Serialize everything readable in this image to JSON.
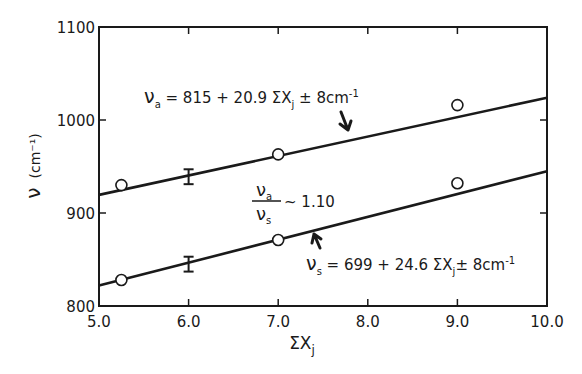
{
  "chart_data": {
    "type": "scatter",
    "title": "",
    "xlabel": "ΣXj",
    "ylabel": "ν (cm⁻¹)",
    "xlim": [
      5.0,
      10.0
    ],
    "ylim": [
      800,
      1100
    ],
    "x_ticks": [
      "5.0",
      "6.0",
      "7.0",
      "8.0",
      "9.0",
      "10.0"
    ],
    "y_ticks": [
      "800",
      "900",
      "1000",
      "1100"
    ],
    "grid": false,
    "series": [
      {
        "name": "νa",
        "points": [
          {
            "x": 5.25,
            "y": 930
          },
          {
            "x": 7.0,
            "y": 963
          },
          {
            "x": 9.0,
            "y": 1016
          }
        ],
        "error_bar": {
          "x": 6.0,
          "y": 939,
          "err": 8
        },
        "fit": {
          "intercept": 815,
          "slope": 20.9,
          "uncertainty": "±8cm-1"
        },
        "annotation": "νa = 815 + 20.9 ΣXj ±8cm⁻¹"
      },
      {
        "name": "νs",
        "points": [
          {
            "x": 5.25,
            "y": 828
          },
          {
            "x": 7.0,
            "y": 871
          },
          {
            "x": 9.0,
            "y": 932
          }
        ],
        "error_bar": {
          "x": 6.0,
          "y": 845,
          "err": 8
        },
        "fit": {
          "intercept": 699,
          "slope": 24.6,
          "uncertainty": "±8cm-1"
        },
        "annotation": "νs = 699 + 24.6 ΣXj ± 8cm⁻¹"
      }
    ],
    "annotations": [
      {
        "text": "νa / νs ~ 1.10",
        "x": 7.1,
        "y": 905
      }
    ]
  },
  "labels": {
    "ylabel_main": "ν",
    "ylabel_unit": "(cm⁻¹)",
    "xlabel_main": "ΣX",
    "xlabel_sub": "j",
    "eq_a_prefix": "ν",
    "eq_a_sub": "a",
    "eq_a_body": " = 815 +  20.9  ΣX",
    "eq_a_sub2": "j",
    "eq_a_tail": " ± 8cm",
    "eq_a_exp": "-1",
    "eq_s_prefix": "ν",
    "eq_s_sub": "s",
    "eq_s_body": " = 699 + 24.6 ΣX",
    "eq_s_sub2": "j",
    "eq_s_tail": "± 8cm",
    "eq_s_exp": "-1",
    "ratio_num": "ν",
    "ratio_num_sub": "a",
    "ratio_den": "ν",
    "ratio_den_sub": "s",
    "ratio_value": "~ 1.10"
  },
  "style": {
    "ink": "#1a1a1a",
    "background": "#ffffff"
  }
}
